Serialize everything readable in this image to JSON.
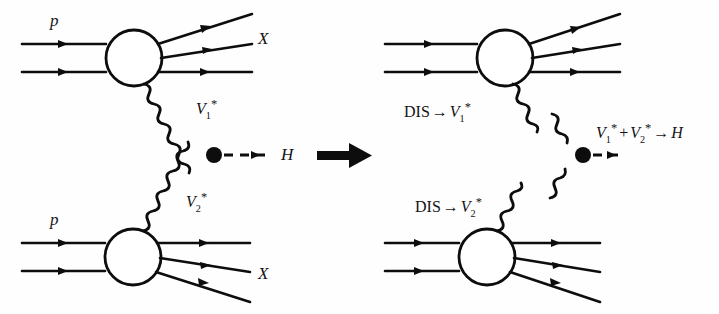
{
  "figure": {
    "type": "feynman-diagram",
    "panels": [
      "left-full-process",
      "right-factorized-process"
    ],
    "transition_symbol": "⟶",
    "colors": {
      "ink": "#0d0d0d",
      "background": "#ffffff"
    }
  },
  "left_panel": {
    "top_vertex": {
      "incoming_label": "p",
      "outgoing_label": "X",
      "exchange_label_base": "V",
      "exchange_label_sub": "1",
      "exchange_label_star": "*"
    },
    "bottom_vertex": {
      "incoming_label": "p",
      "outgoing_label": "X",
      "exchange_label_base": "V",
      "exchange_label_sub": "2",
      "exchange_label_star": "*"
    },
    "higgs_label": "H"
  },
  "right_panel": {
    "top_annotation": {
      "prefix": "DIS",
      "arrow": "→",
      "base": "V",
      "sub": "1",
      "star": "*"
    },
    "bottom_annotation": {
      "prefix": "DIS",
      "arrow": "→",
      "base": "V",
      "sub": "2",
      "star": "*"
    },
    "fusion_annotation": {
      "v1_base": "V",
      "v1_sub": "1",
      "v1_star": "*",
      "plus": "+",
      "v2_base": "V",
      "v2_sub": "2",
      "v2_star": "*",
      "arrow": "→",
      "result": "H"
    }
  }
}
